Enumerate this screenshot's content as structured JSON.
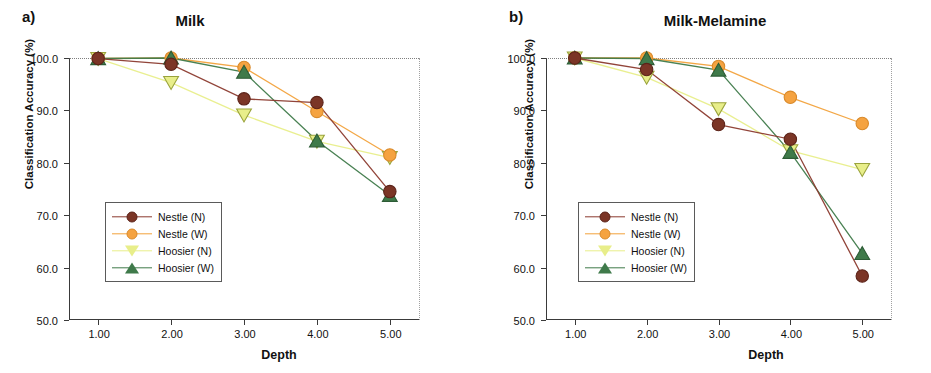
{
  "figure": {
    "panels": [
      {
        "label": "a)",
        "title": "Milk",
        "xlabel": "Depth",
        "ylabel": "Classification Accuracy (%)",
        "legend_labels": [
          "Nestle (N)",
          "Nestle (W)",
          "Hoosier (N)",
          "Hoosier (W)"
        ]
      },
      {
        "label": "b)",
        "title": "Milk-Melamine",
        "xlabel": "Depth",
        "ylabel": "Classification Accuracy (%)",
        "legend_labels": [
          "Nestle (N)",
          "Nestle (W)",
          "Hoosier (N)",
          "Hoosier (W)"
        ]
      }
    ]
  },
  "colors": {
    "nestle_n": "#8B3A2E",
    "nestle_n_fill": "#7B3526",
    "nestle_w": "#F2A23C",
    "nestle_w_fill": "#F5A341",
    "hoosier_n": "#F2EE9A",
    "hoosier_n_fill": "#E8EE8A",
    "hoosier_w": "#63A77F",
    "hoosier_w_fill": "#3F7A4A",
    "axis": "#3a3a3a",
    "text": "#111111",
    "background": "#ffffff"
  },
  "chart_data": [
    {
      "type": "line",
      "panel": "a",
      "title": "Milk",
      "xlabel": "Depth",
      "ylabel": "Classification Accuracy (%)",
      "x": [
        1,
        2,
        3,
        4,
        5
      ],
      "xticklabels": [
        "1.00",
        "2.00",
        "3.00",
        "4.00",
        "5.00"
      ],
      "yticklabels": [
        "50.0",
        "60.0",
        "70.0",
        "80.0",
        "90.0",
        "100.0"
      ],
      "yticks": [
        50,
        60,
        70,
        80,
        90,
        100
      ],
      "xlim": [
        0.6,
        5.4
      ],
      "ylim": [
        50,
        100
      ],
      "grid": false,
      "legend_position": "lower-left",
      "series": [
        {
          "name": "Nestle (N)",
          "marker": "circle",
          "color": "#8B3A2E",
          "values": [
            99.9,
            98.8,
            92.2,
            91.5,
            74.5
          ]
        },
        {
          "name": "Nestle (W)",
          "marker": "circle",
          "color": "#F2A23C",
          "values": [
            99.9,
            100.0,
            98.2,
            89.8,
            81.5
          ]
        },
        {
          "name": "Hoosier (N)",
          "marker": "triangle-down",
          "color": "#E8EE8A",
          "values": [
            99.9,
            95.3,
            89.1,
            84.1,
            81.0
          ]
        },
        {
          "name": "Hoosier (W)",
          "marker": "triangle-up",
          "color": "#3F7A4A",
          "values": [
            99.9,
            100.0,
            97.3,
            84.2,
            73.8
          ]
        }
      ]
    },
    {
      "type": "line",
      "panel": "b",
      "title": "Milk-Melamine",
      "xlabel": "Depth",
      "ylabel": "Classification Accuracy (%)",
      "x": [
        1,
        2,
        3,
        4,
        5
      ],
      "xticklabels": [
        "1.00",
        "2.00",
        "3.00",
        "4.00",
        "5.00"
      ],
      "yticklabels": [
        "50.0",
        "60.0",
        "70.0",
        "80.0",
        "90.0",
        "100.0"
      ],
      "yticks": [
        50,
        60,
        70,
        80,
        90,
        100
      ],
      "xlim": [
        0.6,
        5.4
      ],
      "ylim": [
        50,
        100
      ],
      "grid": false,
      "legend_position": "lower-left",
      "series": [
        {
          "name": "Nestle (N)",
          "marker": "circle",
          "color": "#8B3A2E",
          "values": [
            100.0,
            97.8,
            87.3,
            84.5,
            58.4
          ]
        },
        {
          "name": "Nestle (W)",
          "marker": "circle",
          "color": "#F2A23C",
          "values": [
            100.0,
            100.0,
            98.4,
            92.5,
            87.5
          ]
        },
        {
          "name": "Hoosier (N)",
          "marker": "triangle-down",
          "color": "#E8EE8A",
          "values": [
            100.0,
            96.3,
            90.3,
            82.3,
            78.7
          ]
        },
        {
          "name": "Hoosier (W)",
          "marker": "triangle-up",
          "color": "#3F7A4A",
          "values": [
            100.0,
            99.9,
            97.7,
            82.0,
            62.7
          ]
        }
      ]
    }
  ]
}
